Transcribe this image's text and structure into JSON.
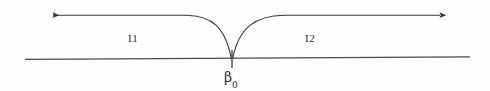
{
  "figure": {
    "kind": "contour-deformation-diagram",
    "background_color": "#fefefe",
    "stroke_color": "#3a3a3a",
    "text_color": "#2b2b2b",
    "width": 490,
    "height": 91,
    "labels": {
      "region_left": "I1",
      "region_right": "I2",
      "cusp_point_base": "β",
      "cusp_point_subscript": "0",
      "cusp_point_full": "β₀"
    },
    "geometry": {
      "baseline_y": 58,
      "baseline_x_start": 25,
      "baseline_x_end": 470,
      "contour_y": 15,
      "left_arrow_x": 50,
      "right_arrow_x": 443,
      "cusp_x": 232,
      "cusp_y": 58,
      "tick_bottom_y": 68
    }
  }
}
